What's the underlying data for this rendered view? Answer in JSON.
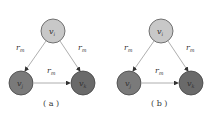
{
  "panels": [
    {
      "caption": "( a )",
      "nodes": {
        "top": {
          "label": "v",
          "sub": "i",
          "color": "#c8c8c8"
        },
        "left": {
          "label": "v",
          "sub": "j",
          "color": "#7a7a7a"
        },
        "right": {
          "label": "v",
          "sub": "k",
          "color": "#6a6a6a"
        }
      },
      "edges": [
        {
          "from": "top",
          "to": "left",
          "label": "r",
          "sub": "m"
        },
        {
          "from": "top",
          "to": "right",
          "label": "r",
          "sub": "m"
        },
        {
          "from": "left",
          "to": "right",
          "label": "r",
          "sub": "m"
        }
      ]
    },
    {
      "caption": "( b )",
      "nodes": {
        "top": {
          "label": "v",
          "sub": "i",
          "color": "#c8c8c8"
        },
        "left": {
          "label": "v",
          "sub": "j",
          "color": "#7a7a7a"
        },
        "right": {
          "label": "v",
          "sub": "k",
          "color": "#6a6a6a"
        }
      },
      "edges": [
        {
          "from": "top",
          "to": "left",
          "label": "r",
          "sub": "m"
        },
        {
          "from": "top",
          "to": "right",
          "label": "r",
          "sub": "m"
        },
        {
          "from": "left",
          "to": "right",
          "label": "r",
          "sub": "m"
        }
      ]
    }
  ]
}
